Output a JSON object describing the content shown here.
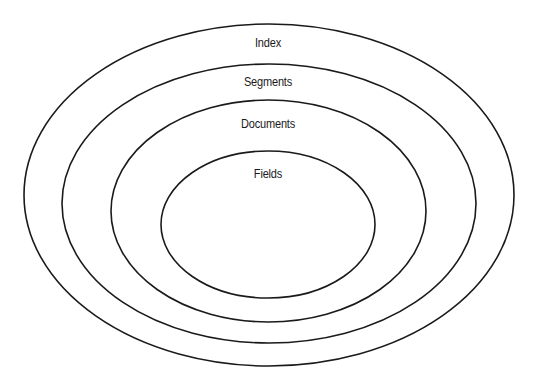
{
  "diagram": {
    "layers": [
      {
        "label": "Index",
        "cx": 269,
        "cy": 195,
        "rx": 245,
        "ry": 171,
        "label_x": 268,
        "label_y": 43
      },
      {
        "label": "Segments",
        "cx": 269,
        "cy": 203.5,
        "rx": 207,
        "ry": 139.5,
        "label_x": 268,
        "label_y": 82
      },
      {
        "label": "Documents",
        "cx": 268.5,
        "cy": 211,
        "rx": 157.5,
        "ry": 111,
        "label_x": 268,
        "label_y": 124
      },
      {
        "label": "Fields",
        "cx": 268,
        "cy": 224.5,
        "rx": 107,
        "ry": 73.5,
        "label_x": 268,
        "label_y": 174
      }
    ],
    "stroke_color": "#1a1a1a",
    "background": "#ffffff"
  }
}
